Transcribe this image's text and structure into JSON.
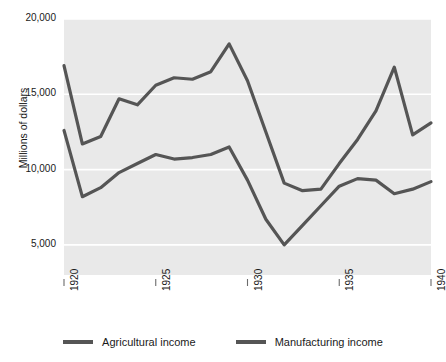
{
  "chart_data": {
    "type": "line",
    "title": "",
    "xlabel": "",
    "ylabel": "Millions of dollars",
    "x": [
      1920,
      1921,
      1922,
      1923,
      1924,
      1925,
      1926,
      1927,
      1928,
      1929,
      1930,
      1931,
      1932,
      1933,
      1934,
      1935,
      1936,
      1937,
      1938,
      1939,
      1940
    ],
    "xlim": [
      1920,
      1940
    ],
    "ylim": [
      3000,
      20000
    ],
    "yticks": [
      5000,
      10000,
      15000,
      20000
    ],
    "ytick_labels": [
      "5,000",
      "10,000",
      "15,000",
      "20,000"
    ],
    "xticks": [
      1920,
      1925,
      1930,
      1935,
      1940
    ],
    "xtick_labels": [
      "1920",
      "1925",
      "1930",
      "1935",
      "1940"
    ],
    "grid": true,
    "grid_color": "#ffffff",
    "plot_background": "#e9e9e9",
    "legend_position": "bottom",
    "series": [
      {
        "name": "Agricultural income",
        "color": "#555555",
        "values": [
          12600,
          8200,
          8800,
          9800,
          10400,
          11000,
          10700,
          10800,
          11000,
          11500,
          9300,
          6700,
          5000,
          6300,
          7600,
          8900,
          9400,
          9300,
          8400,
          8700,
          9200
        ]
      },
      {
        "name": "Manufacturing income",
        "color": "#555555",
        "values": [
          16900,
          11700,
          12200,
          14700,
          14300,
          15600,
          16100,
          16000,
          16500,
          18350,
          15900,
          12500,
          9100,
          8600,
          8700,
          10400,
          12000,
          13900,
          16800,
          12300,
          13100
        ]
      }
    ]
  },
  "axis": {
    "y_title": "Millions of dollars"
  }
}
